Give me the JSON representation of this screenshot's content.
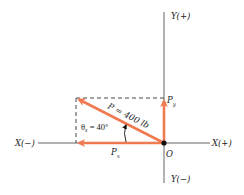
{
  "diagram": {
    "type": "force-vector-components",
    "axes": {
      "x_positive_label": "X(+)",
      "x_negative_label": "X(−)",
      "y_positive_label": "Y(+)",
      "y_negative_label": "Y(−)",
      "origin_label": "O"
    },
    "vectors": {
      "resultant": {
        "label": "P = 400 lb",
        "magnitude": "400 lb"
      },
      "x_component": {
        "label": "P",
        "subscript": "x"
      },
      "y_component": {
        "label": "P",
        "subscript": "y"
      }
    },
    "angle": {
      "symbol": "θ",
      "subscript": "x",
      "text": " = 40°"
    },
    "colors": {
      "vector": "#f07a50",
      "axis": "#555555",
      "dashed": "#333333",
      "origin": "#111111"
    }
  }
}
